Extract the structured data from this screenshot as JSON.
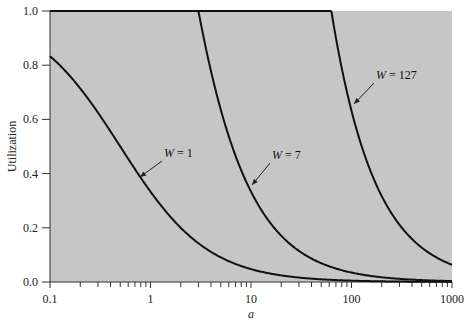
{
  "chart_data": {
    "type": "line",
    "title": "",
    "xlabel": "a",
    "ylabel": "Utilization",
    "xscale": "log",
    "xlim": [
      0.1,
      1000
    ],
    "ylim": [
      0.0,
      1.0
    ],
    "grid": false,
    "x_ticks": [
      0.1,
      1,
      10,
      100,
      1000
    ],
    "x_tick_labels": [
      "0.1",
      "1",
      "10",
      "100",
      "1000"
    ],
    "y_ticks": [
      0.0,
      0.2,
      0.4,
      0.6,
      0.8,
      1.0
    ],
    "y_tick_labels": [
      "0.0",
      "0.2",
      "0.4",
      "0.6",
      "0.8",
      "1.0"
    ],
    "series": [
      {
        "name": "W = 1",
        "window": 1,
        "formula": "U = min(1, W/(1+2a))",
        "x": [
          0.1,
          0.2,
          0.5,
          1,
          2,
          5,
          10,
          20,
          50,
          100,
          1000
        ],
        "values": [
          0.833,
          0.714,
          0.5,
          0.333,
          0.2,
          0.091,
          0.048,
          0.024,
          0.01,
          0.005,
          0.0005
        ],
        "label": {
          "text_prefix": "W",
          "text_suffix": " = 1",
          "x": 164,
          "y": 157,
          "arrow_to": [
            140,
            177
          ]
        }
      },
      {
        "name": "W = 7",
        "window": 7,
        "formula": "U = min(1, W/(1+2a))",
        "x": [
          0.1,
          1,
          3,
          5,
          10,
          20,
          50,
          100,
          1000
        ],
        "values": [
          1.0,
          1.0,
          1.0,
          0.636,
          0.333,
          0.171,
          0.069,
          0.035,
          0.0035
        ],
        "label": {
          "text_prefix": "W",
          "text_suffix": " = 7",
          "x": 272,
          "y": 159,
          "arrow_to": [
            252,
            185
          ]
        }
      },
      {
        "name": "W = 127",
        "window": 127,
        "formula": "U = min(1, W/(1+2a))",
        "x": [
          0.1,
          1,
          10,
          63,
          100,
          200,
          500,
          1000
        ],
        "values": [
          1.0,
          1.0,
          1.0,
          1.0,
          0.632,
          0.317,
          0.127,
          0.063
        ],
        "label": {
          "text_prefix": "W",
          "text_suffix": " = 127",
          "x": 376,
          "y": 79,
          "arrow_to": [
            354,
            104
          ]
        }
      }
    ],
    "colors": {
      "plot_background": "#c6c6c6",
      "line": "#111111",
      "axis": "#333333"
    }
  }
}
